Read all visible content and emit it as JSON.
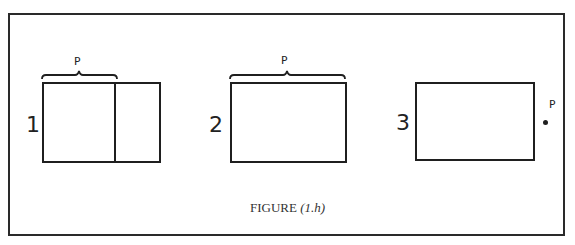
{
  "figure": {
    "caption_label": "FIGURE",
    "caption_ref": "(1.h)"
  },
  "panels": [
    {
      "number": "1",
      "p_label": "P",
      "description": "Rectangle divided by a vertical line; brace P spans the left portion"
    },
    {
      "number": "2",
      "p_label": "P",
      "description": "Rectangle with brace P spanning full width"
    },
    {
      "number": "3",
      "p_label": "P",
      "description": "Rectangle with point P outside on the right"
    }
  ],
  "colors": {
    "ink": "#1f1f1f",
    "background": "#ffffff"
  }
}
